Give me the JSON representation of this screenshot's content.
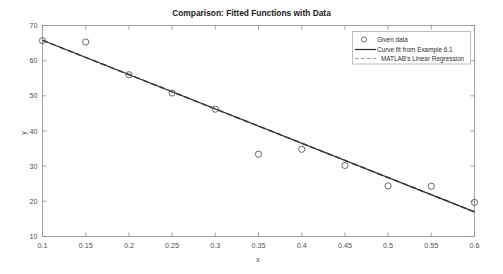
{
  "chart_data": {
    "type": "scatter",
    "title": "Comparison: Fitted Functions with Data",
    "xlabel": "x",
    "ylabel": "y",
    "xlim": [
      0.1,
      0.6
    ],
    "ylim": [
      10,
      70
    ],
    "xticks": [
      0.1,
      0.15,
      0.2,
      0.25,
      0.3,
      0.35,
      0.4,
      0.45,
      0.5,
      0.55,
      0.6
    ],
    "xtick_labels": [
      "0.1",
      "0.15",
      "0.2",
      "0.25",
      "0.3",
      "0.35",
      "0.4",
      "0.45",
      "0.5",
      "0.55",
      "0.6"
    ],
    "yticks": [
      10,
      20,
      30,
      40,
      50,
      60,
      70
    ],
    "ytick_labels": [
      "10",
      "20",
      "30",
      "40",
      "50",
      "60",
      "70"
    ],
    "grid": false,
    "legend_position": "top-right",
    "series": [
      {
        "name": "Given data",
        "style": "markers",
        "marker": "circle-open",
        "color": "#59595e",
        "x": [
          0.1,
          0.15,
          0.2,
          0.25,
          0.3,
          0.35,
          0.4,
          0.45,
          0.5,
          0.55,
          0.6
        ],
        "values": [
          65.7,
          65.3,
          56.0,
          50.8,
          46.2,
          33.4,
          34.8,
          30.2,
          24.4,
          24.3,
          19.7
        ]
      },
      {
        "name": "Curve fit from Example 6.1",
        "style": "solid-line",
        "color": "#2b2b2b",
        "x": [
          0.1,
          0.6
        ],
        "values": [
          65.8,
          17.0
        ]
      },
      {
        "name": "MATLAB's Linear Regression",
        "style": "dashed-line",
        "color": "#3a3a3a",
        "x": [
          0.1,
          0.6
        ],
        "values": [
          65.8,
          17.0
        ]
      }
    ]
  },
  "chart": {
    "title": "Comparison: Fitted Functions with Data",
    "xlabel": "x",
    "ylabel": "y",
    "xtick_labels": [
      "0.1",
      "0.15",
      "0.2",
      "0.25",
      "0.3",
      "0.35",
      "0.4",
      "0.45",
      "0.5",
      "0.55",
      "0.6"
    ],
    "ytick_labels": [
      "10",
      "20",
      "30",
      "40",
      "50",
      "60",
      "70"
    ]
  },
  "legend": {
    "items": [
      {
        "label": "Given data"
      },
      {
        "label": "Curve fit from Example 6.1"
      },
      {
        "label": "MATLAB's Linear Regression"
      }
    ]
  }
}
